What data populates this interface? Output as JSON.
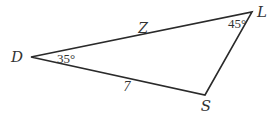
{
  "diagram": {
    "type": "triangle",
    "stroke_color": "#2a2a2a",
    "vertices": {
      "D": {
        "label": "D",
        "x": 31,
        "y": 57
      },
      "L": {
        "label": "L",
        "x": 252,
        "y": 12
      },
      "S": {
        "label": "S",
        "x": 205,
        "y": 95
      }
    },
    "angles": {
      "D": "35°",
      "L": "45°"
    },
    "sides": {
      "DL": "Z",
      "DS": "7"
    }
  }
}
